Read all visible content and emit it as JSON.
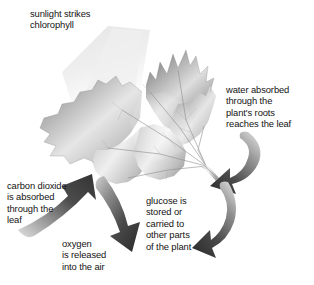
{
  "diagram": {
    "background_color": "#ffffff",
    "text_color": "#131313",
    "arrow_color_dark": "#3b3b3b",
    "arrow_color_light": "#d8d8d8",
    "leaf_color_dark": "#6e6e6e",
    "leaf_color_light": "#f2f2f2",
    "sunbeam_color": "#ececec"
  },
  "labels": {
    "sunlight": "sunlight strikes\nchlorophyll",
    "water": "water absorbed\nthrough the\nplant's roots\nreaches the leaf",
    "carbon_dioxide": "carbon dioxide\nis absorbed\nthrough the\nleaf",
    "glucose": "glucose is\nstored or\ncarried to\nother parts\nof the plant",
    "oxygen": "oxygen\nis released\ninto the air"
  },
  "elements": {
    "leaf": "maple-leaf-illustration",
    "sunbeam": "sunlight-beam",
    "stem": "leaf-stem",
    "arrow_co2": "carbon-dioxide-inflow-arrow",
    "arrow_oxygen": "oxygen-outflow-arrow",
    "arrow_water": "water-inflow-arrow",
    "arrow_glucose": "glucose-outflow-arrow"
  }
}
